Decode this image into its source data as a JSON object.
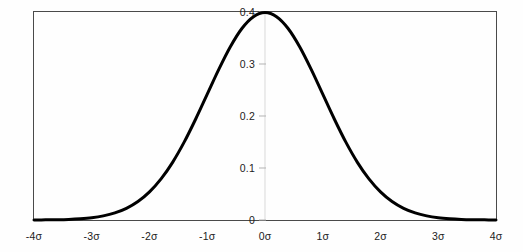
{
  "chart_data": {
    "type": "line",
    "title": "",
    "subtitle": "",
    "xlabel": "",
    "ylabel": "",
    "xlim": [
      -4,
      4
    ],
    "ylim": [
      0,
      0.4
    ],
    "grid": false,
    "legend": null,
    "legend_position": "none",
    "x_tick_labels": [
      "-4σ",
      "-3σ",
      "-2σ",
      "-1σ",
      "0σ",
      "1σ",
      "2σ",
      "3σ",
      "4σ"
    ],
    "x_tick_values": [
      -4,
      -3,
      -2,
      -1,
      0,
      1,
      2,
      3,
      4
    ],
    "y_tick_labels": [
      "0",
      "0.1",
      "0.2",
      "0.3",
      "0.4"
    ],
    "y_tick_values": [
      0,
      0.1,
      0.2,
      0.3,
      0.4
    ],
    "series": [
      {
        "name": "standard normal probability density",
        "color": "#000000",
        "line_width": 3,
        "x": [
          -4,
          -3.8,
          -3.6,
          -3.4,
          -3.2,
          -3,
          -2.8,
          -2.6,
          -2.4,
          -2.2,
          -2,
          -1.8,
          -1.6,
          -1.4,
          -1.2,
          -1,
          -0.8,
          -0.6,
          -0.4,
          -0.2,
          0,
          0.2,
          0.4,
          0.6,
          0.8,
          1,
          1.2,
          1.4,
          1.6,
          1.8,
          2,
          2.2,
          2.4,
          2.6,
          2.8,
          3,
          3.2,
          3.4,
          3.6,
          3.8,
          4
        ],
        "values": [
          0.0001,
          0.0003,
          0.0006,
          0.0012,
          0.0024,
          0.0044,
          0.0079,
          0.0136,
          0.0224,
          0.0355,
          0.054,
          0.079,
          0.1109,
          0.1497,
          0.1942,
          0.242,
          0.2897,
          0.3332,
          0.3683,
          0.391,
          0.3989,
          0.391,
          0.3683,
          0.3332,
          0.2897,
          0.242,
          0.1942,
          0.1497,
          0.1109,
          0.079,
          0.054,
          0.0355,
          0.0224,
          0.0136,
          0.0079,
          0.0044,
          0.0024,
          0.0012,
          0.0006,
          0.0003,
          0.0001
        ]
      }
    ],
    "annotations": [],
    "colors": {
      "curve": "#000000",
      "border": "#4a4a4a",
      "axis_gridline": "#d9d9d9",
      "tick_mark": "#b3b3b3",
      "label_text": "#1c1c1c",
      "background": "#fefefe"
    }
  }
}
